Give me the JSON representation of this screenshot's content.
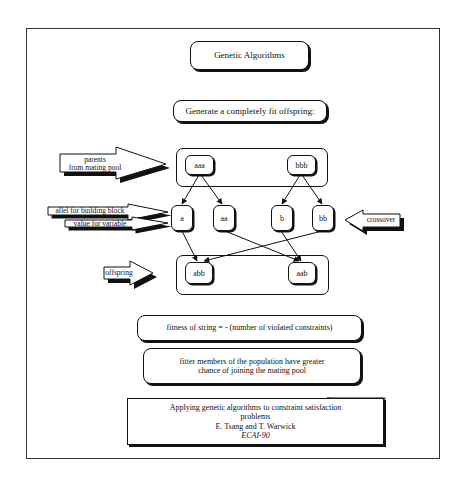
{
  "title": "Genetic Algorithms",
  "subtitle": "Generate a completely fit offspring:",
  "parents_group": {
    "nodes": [
      "aaa",
      "bbb"
    ]
  },
  "building_blocks": {
    "nodes": [
      "a",
      "aa",
      "b",
      "bb"
    ]
  },
  "offspring_group": {
    "nodes": [
      "abb",
      "aab"
    ]
  },
  "annotations": {
    "parents_line1": "parents",
    "parents_line2": "from mating pool",
    "allel": "allel for building block",
    "value": "value for variable",
    "crossover": "crossover",
    "offspring": "offspring"
  },
  "edges": [
    {
      "from": "aaa",
      "to": "a"
    },
    {
      "from": "aaa",
      "to": "aa"
    },
    {
      "from": "bbb",
      "to": "b"
    },
    {
      "from": "bbb",
      "to": "bb"
    },
    {
      "from": "a",
      "to": "abb"
    },
    {
      "from": "bb",
      "to": "abb"
    },
    {
      "from": "aa",
      "to": "aab"
    },
    {
      "from": "b",
      "to": "aab"
    }
  ],
  "fitness_text": "fitness of string = - (number of violated constraints)",
  "fitter_line1": "fitter members of the population have greater",
  "fitter_line2": "chance of joining the mating pool",
  "reference": {
    "line1": "Applying genetic algorithms to constraint satisfaction",
    "line2": "problems",
    "authors": "E. Tsang and T. Warwick",
    "venue": "ECAI-90"
  }
}
